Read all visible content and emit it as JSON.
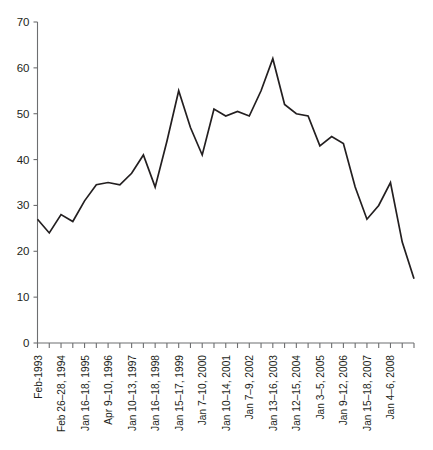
{
  "chart_data": {
    "type": "line",
    "title": "",
    "subtitle": "",
    "xlabel": "",
    "ylabel": "",
    "ylim": [
      0,
      70
    ],
    "ytick_values": [
      0,
      10,
      20,
      30,
      40,
      50,
      60,
      70
    ],
    "ytick_labels": [
      "0",
      "10",
      "20",
      "30",
      "40",
      "50",
      "60",
      "70"
    ],
    "grid": false,
    "legend": false,
    "legend_position": "none",
    "n_ticks": 33,
    "labeled_tick_indices": [
      0,
      2,
      4,
      6,
      8,
      10,
      12,
      14,
      16,
      18,
      20,
      22,
      24,
      26,
      28,
      30
    ],
    "xtick_labels": [
      "Feb-1993",
      "Feb 26–28, 1994",
      "Jan 16–18, 1995",
      "Apr 9–10, 1996",
      "Jan 10–13, 1997",
      "Jan 16–18, 1998",
      "Jan 15–17, 1999",
      "Jan 7–10, 2000",
      "Jan 10–14, 2001",
      "Jan 7–9, 2002",
      "Jan 13–16, 2003",
      "Jan 12–15, 2004",
      "Jan 3–5, 2005",
      "Jan 9–12, 2006",
      "Jan 15–18, 2007",
      "Jan 4–6, 2008"
    ],
    "x": [
      0,
      1,
      2,
      3,
      4,
      5,
      6,
      7,
      8,
      9,
      10,
      11,
      12,
      13,
      14,
      15,
      16,
      17,
      18,
      19,
      20,
      21,
      22,
      23,
      24,
      25,
      26,
      27,
      28,
      29,
      30,
      31,
      32
    ],
    "values": [
      27,
      24,
      28,
      26.5,
      31,
      34.5,
      35,
      34.5,
      37,
      41,
      34,
      44,
      55,
      47,
      41,
      51,
      49.5,
      50.5,
      49.5,
      55,
      62,
      52,
      50,
      49.5,
      43,
      45,
      43.5,
      34,
      27,
      30,
      35,
      22,
      14
    ],
    "series": [
      {
        "name": "Attendance",
        "values": [
          27,
          24,
          28,
          26.5,
          31,
          34.5,
          35,
          34.5,
          37,
          41,
          34,
          44,
          55,
          47,
          41,
          51,
          49.5,
          50.5,
          49.5,
          55,
          62,
          52,
          50,
          49.5,
          43,
          45,
          43.5,
          34,
          27,
          30,
          35,
          22,
          14
        ],
        "color": "#231f20"
      }
    ]
  },
  "colors": {
    "line": "#231f20",
    "axis": "#6d6e70",
    "text": "#231f20",
    "background": "#ffffff"
  }
}
